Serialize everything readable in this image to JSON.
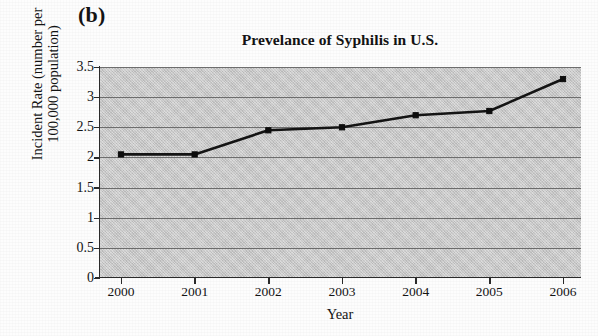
{
  "figure": {
    "panel_label": "(b)",
    "background_color": "#fdfdfd"
  },
  "chart_data": {
    "type": "line",
    "title": "Prevelance of Syphilis in U.S.",
    "xlabel": "Year",
    "ylabel": "Incident Rate (number per 100,000 population)",
    "ylabel_line1": "Incident Rate (number per",
    "ylabel_line2": "100,000 population)",
    "categories": [
      "2000",
      "2001",
      "2002",
      "2003",
      "2004",
      "2005",
      "2006"
    ],
    "x": [
      2000,
      2001,
      2002,
      2003,
      2004,
      2005,
      2006
    ],
    "values": [
      2.05,
      2.05,
      2.45,
      2.5,
      2.7,
      2.77,
      3.3
    ],
    "series": [
      {
        "name": "Incident Rate",
        "values": [
          2.05,
          2.05,
          2.45,
          2.5,
          2.7,
          2.77,
          3.3
        ]
      }
    ],
    "ylim": [
      0,
      3.5
    ],
    "xlim": [
      2000,
      2006
    ],
    "yticks": [
      0,
      0.5,
      1,
      1.5,
      2,
      2.5,
      3,
      3.5
    ],
    "ytick_labels": [
      "0",
      "0.5",
      "1",
      "1.5",
      "2",
      "2.5",
      "3",
      "3.5"
    ],
    "xtick_labels": [
      "2000",
      "2001",
      "2002",
      "2003",
      "2004",
      "2005",
      "2006"
    ],
    "grid": true,
    "grid_axis": "y",
    "legend": false,
    "legend_position": "none",
    "marker": "square",
    "line_color": "#141414",
    "marker_color": "#0d0d0d",
    "plot_background_color": "#c9c9c9",
    "gridline_color": "#6e6e6e"
  }
}
